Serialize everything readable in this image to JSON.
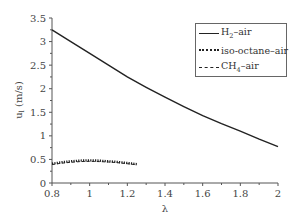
{
  "chart_data": {
    "type": "line",
    "title": "",
    "xlabel": "λ",
    "ylabel": "u_l (m/s)",
    "xlim": [
      0.8,
      2.0
    ],
    "ylim": [
      0,
      3.5
    ],
    "xticks": [
      0.8,
      1.0,
      1.2,
      1.4,
      1.6,
      1.8,
      2.0
    ],
    "xtick_labels": [
      "0.8",
      "1",
      "1.2",
      "1.4",
      "1.6",
      "1.8",
      "2"
    ],
    "yticks": [
      0,
      0.5,
      1,
      1.5,
      2,
      2.5,
      3,
      3.5
    ],
    "ytick_labels": [
      "0",
      "0.5",
      "1",
      "1.5",
      "2",
      "2.5",
      "3",
      "3.5"
    ],
    "grid": false,
    "legend_position": "upper right",
    "series": [
      {
        "name": "H2–air",
        "style": "solid",
        "x": [
          0.8,
          0.9,
          1.0,
          1.1,
          1.2,
          1.3,
          1.4,
          1.5,
          1.6,
          1.7,
          1.8,
          1.9,
          2.0
        ],
        "values": [
          3.25,
          3.0,
          2.75,
          2.5,
          2.25,
          2.03,
          1.82,
          1.62,
          1.43,
          1.26,
          1.1,
          0.93,
          0.77
        ]
      },
      {
        "name": "iso-octane–air",
        "style": "dotted",
        "x": [
          0.8,
          0.85,
          0.9,
          0.95,
          1.0,
          1.05,
          1.1,
          1.15,
          1.2,
          1.25
        ],
        "values": [
          0.41,
          0.44,
          0.46,
          0.475,
          0.48,
          0.475,
          0.46,
          0.445,
          0.425,
          0.4
        ]
      },
      {
        "name": "CH4–air",
        "style": "dashed",
        "x": [
          0.8,
          0.85,
          0.9,
          0.95,
          1.0,
          1.05,
          1.1,
          1.15,
          1.2,
          1.25
        ],
        "values": [
          0.39,
          0.42,
          0.44,
          0.455,
          0.46,
          0.455,
          0.445,
          0.43,
          0.41,
          0.385
        ]
      }
    ]
  },
  "legend": {
    "items": [
      {
        "base": "H",
        "sub": "2",
        "rest": "–air"
      },
      {
        "base": "iso-octane–air",
        "sub": "",
        "rest": ""
      },
      {
        "base": "CH",
        "sub": "4",
        "rest": "–air"
      }
    ]
  },
  "axes": {
    "x_label": "λ",
    "y_label_main": "u",
    "y_label_sub": "l",
    "y_label_unit": " (m/s)"
  }
}
